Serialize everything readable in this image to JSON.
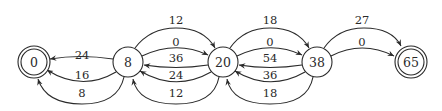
{
  "diagram": {
    "type": "state-transition-graph",
    "nodes": [
      {
        "id": "n0",
        "label": "0",
        "accepting": true
      },
      {
        "id": "n8",
        "label": "8",
        "accepting": false
      },
      {
        "id": "n20",
        "label": "20",
        "accepting": false
      },
      {
        "id": "n38",
        "label": "38",
        "accepting": false
      },
      {
        "id": "n65",
        "label": "65",
        "accepting": true
      }
    ],
    "edges": [
      {
        "from": "8",
        "to": "20",
        "label": "12"
      },
      {
        "from": "8",
        "to": "20",
        "label": "0"
      },
      {
        "from": "20",
        "to": "8",
        "label": "36"
      },
      {
        "from": "20",
        "to": "8",
        "label": "24"
      },
      {
        "from": "20",
        "to": "8",
        "label": "12"
      },
      {
        "from": "20",
        "to": "38",
        "label": "18"
      },
      {
        "from": "20",
        "to": "38",
        "label": "0"
      },
      {
        "from": "38",
        "to": "20",
        "label": "54"
      },
      {
        "from": "38",
        "to": "20",
        "label": "36"
      },
      {
        "from": "38",
        "to": "20",
        "label": "18"
      },
      {
        "from": "38",
        "to": "65",
        "label": "27"
      },
      {
        "from": "38",
        "to": "65",
        "label": "0"
      },
      {
        "from": "8",
        "to": "0",
        "label": "24"
      },
      {
        "from": "8",
        "to": "0",
        "label": "16"
      },
      {
        "from": "8",
        "to": "0",
        "label": "8"
      }
    ]
  }
}
